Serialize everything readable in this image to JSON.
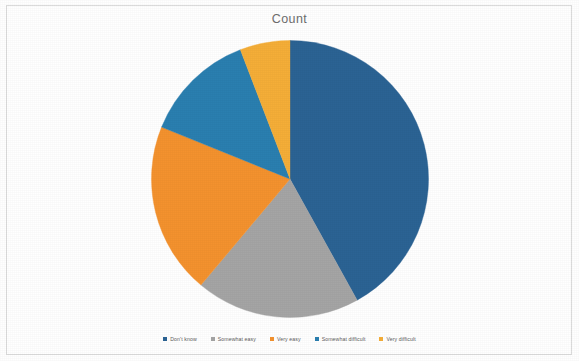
{
  "chart_data": {
    "type": "pie",
    "title": "Count",
    "xlabel": "",
    "ylabel": "",
    "legend_position": "bottom",
    "grid": false,
    "start_angle_deg": 0,
    "direction": "clockwise",
    "categories": [
      "Don't know",
      "Somewhat easy",
      "Very easy",
      "Somewhat difficult",
      "Very difficult"
    ],
    "values": [
      42,
      19,
      20,
      13,
      6
    ],
    "percentages": [
      "42%",
      "19%",
      "20%",
      "13%",
      "6%"
    ],
    "colors": [
      "#2b6394",
      "#a5a5a5",
      "#f4922e",
      "#2a7fb0",
      "#f5ae38"
    ],
    "slices": [
      {
        "label": "Don't know",
        "value": 42,
        "color": "#2b6394",
        "start_deg": 0,
        "end_deg": 151
      },
      {
        "label": "Somewhat easy",
        "value": 19,
        "color": "#a5a5a5",
        "start_deg": 151,
        "end_deg": 220
      },
      {
        "label": "Very easy",
        "value": 20,
        "color": "#f4922e",
        "start_deg": 220,
        "end_deg": 292
      },
      {
        "label": "Somewhat difficult",
        "value": 13,
        "color": "#2a7fb0",
        "start_deg": 292,
        "end_deg": 339
      },
      {
        "label": "Very difficult",
        "value": 6,
        "color": "#f5ae38",
        "start_deg": 339,
        "end_deg": 360
      }
    ]
  },
  "chart": {
    "title": "Count"
  },
  "legend": {
    "items": [
      {
        "label": "Don't know",
        "color": "#2b6394"
      },
      {
        "label": "Somewhat easy",
        "color": "#a5a5a5"
      },
      {
        "label": "Very easy",
        "color": "#f4922e"
      },
      {
        "label": "Somewhat difficult",
        "color": "#2a7fb0"
      },
      {
        "label": "Very difficult",
        "color": "#f5ae38"
      }
    ]
  }
}
